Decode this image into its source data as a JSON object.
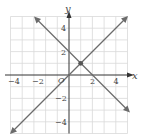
{
  "figure": {
    "type": "coordinate-graph",
    "axes": {
      "x_label": "x",
      "y_label": "y",
      "origin_label": "O",
      "x_ticks": [
        "−4",
        "−2",
        "2",
        "4"
      ],
      "x_tick_values": [
        -4,
        -2,
        2,
        4
      ],
      "y_ticks": [
        "4",
        "2",
        "−2",
        "−4"
      ],
      "y_tick_values": [
        4,
        2,
        -2,
        -4
      ],
      "range": [
        -5,
        5
      ]
    },
    "lines": [
      {
        "name": "line-y-equals-x",
        "equation": "y = x"
      },
      {
        "name": "line-y-equals-neg-x-plus-2",
        "equation": "y = -x + 2"
      }
    ],
    "intersection": {
      "x": 1,
      "y": 1
    },
    "colors": {
      "line": "#6b6b6b",
      "grid": "#d9d9d9",
      "axis": "#333333",
      "point": "#555555"
    }
  }
}
